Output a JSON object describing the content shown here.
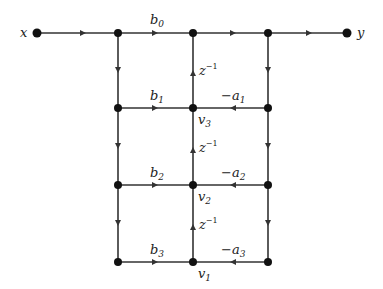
{
  "diagram": {
    "type": "signal-flow-graph",
    "input_label": "x",
    "output_label": "y",
    "feedforward_gains": [
      {
        "name": "b",
        "sub": "0"
      },
      {
        "name": "b",
        "sub": "1"
      },
      {
        "name": "b",
        "sub": "2"
      },
      {
        "name": "b",
        "sub": "3"
      }
    ],
    "feedback_gains": [
      {
        "name": "−a",
        "sub": "1"
      },
      {
        "name": "−a",
        "sub": "2"
      },
      {
        "name": "−a",
        "sub": "3"
      }
    ],
    "delays": [
      {
        "name": "z",
        "sup": "−1"
      },
      {
        "name": "z",
        "sup": "−1"
      },
      {
        "name": "z",
        "sup": "−1"
      }
    ],
    "state_nodes": [
      {
        "name": "v",
        "sub": "3"
      },
      {
        "name": "v",
        "sub": "2"
      },
      {
        "name": "v",
        "sub": "1"
      }
    ]
  }
}
